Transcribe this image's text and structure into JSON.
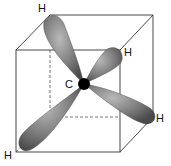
{
  "diagram": {
    "center_atom": "C",
    "labels": {
      "h_top": "H",
      "h_right_upper": "H",
      "h_right_lower": "H",
      "h_bottom_left": "H",
      "carbon": "C"
    },
    "colors": {
      "lobe": "#6a6a6a",
      "nucleus": "#000000",
      "cube_edge": "#333333"
    }
  }
}
